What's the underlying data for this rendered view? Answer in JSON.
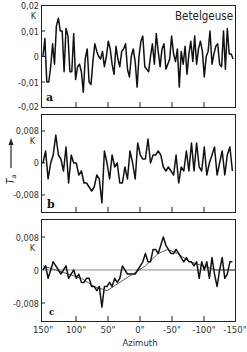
{
  "chart_data": [
    {
      "type": "line",
      "panel": "a",
      "title": "Betelgeuse",
      "ylabel": "T_a (K)",
      "xlabel": "",
      "yunit": "K",
      "ylim": [
        -0.02,
        0.02
      ],
      "yticks": [
        "0,02",
        "0,01",
        "0",
        "-0,01",
        "-0,02"
      ],
      "xlim": [
        150,
        -150
      ],
      "x": [
        150,
        147,
        144,
        141,
        138,
        135,
        132,
        129,
        126,
        123,
        120,
        117,
        114,
        111,
        108,
        105,
        102,
        99,
        96,
        93,
        90,
        87,
        84,
        81,
        78,
        75,
        72,
        69,
        66,
        63,
        60,
        57,
        54,
        51,
        48,
        45,
        42,
        39,
        36,
        33,
        30,
        27,
        24,
        21,
        18,
        15,
        12,
        9,
        6,
        3,
        0,
        -3,
        -6,
        -9,
        -12,
        -15,
        -18,
        -21,
        -24,
        -27,
        -30,
        -33,
        -36,
        -39,
        -42,
        -45,
        -48,
        -51,
        -54,
        -57,
        -60,
        -63,
        -66,
        -69,
        -72,
        -75,
        -78,
        -81,
        -84,
        -87,
        -90,
        -93,
        -96,
        -99,
        -102,
        -105,
        -108,
        -111,
        -114,
        -117,
        -120,
        -123,
        -126,
        -129,
        -132,
        -135,
        -138,
        -141,
        -144,
        -147
      ],
      "values": [
        0.0,
        0.007,
        -0.01,
        -0.01,
        -0.004,
        0.005,
        -0.003,
        0.012,
        0.015,
        0.01,
        0.01,
        -0.006,
        0.011,
        0.008,
        -0.006,
        -0.006,
        0.009,
        -0.009,
        -0.004,
        -0.003,
        -0.006,
        -0.014,
        -0.001,
        0.003,
        -0.01,
        -0.011,
        -0.002,
        0.005,
        0.002,
        0.0,
        -0.001,
        0.002,
        -0.004,
        0.0,
        0.006,
        0.003,
        -0.003,
        -0.007,
        0.004,
        -0.001,
        -0.004,
        0.002,
        0.003,
        0.005,
        -0.005,
        -0.008,
        0.0,
        0.003,
        -0.002,
        -0.012,
        0.0,
        0.006,
        0.008,
        -0.004,
        -0.005,
        -0.006,
        0.0,
        0.005,
        -0.003,
        0.009,
        0.002,
        -0.004,
        0.003,
        0.005,
        -0.005,
        -0.003,
        -0.001,
        0.008,
        0.001,
        -0.002,
        0.003,
        -0.012,
        0.002,
        -0.003,
        0.004,
        -0.007,
        0.001,
        0.006,
        -0.002,
        0.008,
        -0.003,
        0.003,
        0.006,
        0.002,
        -0.008,
        0.0,
        0.002,
        0.01,
        -0.003,
        0.001,
        0.004,
        0.005,
        -0.003,
        -0.004,
        0.01,
        -0.005,
        0.011,
        0.001,
        0.001,
        -0.001
      ]
    },
    {
      "type": "line",
      "panel": "b",
      "ylabel": "T_a (K)",
      "yunit": "K",
      "ylim": [
        -0.0125,
        0.0125
      ],
      "yticks": [
        "0,008",
        "0",
        "-0,008"
      ],
      "xlim": [
        150,
        -150
      ],
      "x": [
        150,
        146,
        142,
        138,
        134,
        130,
        126,
        122,
        118,
        114,
        110,
        106,
        102,
        98,
        94,
        90,
        86,
        82,
        78,
        74,
        70,
        66,
        62,
        58,
        54,
        50,
        46,
        42,
        38,
        34,
        30,
        26,
        22,
        18,
        14,
        10,
        6,
        2,
        -2,
        -6,
        -10,
        -14,
        -18,
        -22,
        -26,
        -30,
        -34,
        -38,
        -42,
        -46,
        -50,
        -54,
        -58,
        -62,
        -66,
        -70,
        -74,
        -78,
        -82,
        -86,
        -90,
        -94,
        -98,
        -102,
        -106,
        -110,
        -114,
        -118,
        -122,
        -126,
        -130,
        -134,
        -138,
        -142,
        -146
      ],
      "values": [
        0.0,
        0.003,
        -0.004,
        0.0,
        0.002,
        0.007,
        0.002,
        0.001,
        -0.002,
        0.004,
        -0.005,
        0.002,
        0.0,
        0.0,
        -0.003,
        -0.002,
        -0.005,
        -0.005,
        -0.006,
        -0.007,
        -0.006,
        -0.003,
        -0.004,
        -0.01,
        0.003,
        0.0,
        -0.004,
        0.002,
        -0.001,
        0.0,
        -0.005,
        -0.005,
        -0.001,
        -0.004,
        0.003,
        0.0,
        -0.004,
        0.005,
        0.002,
        0.001,
        0.001,
        0.006,
        0.0,
        0.002,
        0.002,
        0.003,
        0.002,
        -0.001,
        -0.002,
        -0.001,
        -0.002,
        -0.003,
        0.002,
        -0.005,
        -0.001,
        -0.002,
        0.003,
        -0.002,
        0.005,
        -0.002,
        0.005,
        -0.001,
        -0.002,
        0.004,
        -0.003,
        0.0,
        0.002,
        0.004,
        -0.003,
        0.0,
        0.003,
        -0.003,
        0.002,
        0.004,
        -0.002
      ]
    },
    {
      "type": "line",
      "panel": "c",
      "xlabel": "Azimuth",
      "ylabel": "T_a (K)",
      "yunit": "K",
      "ylim": [
        -0.0125,
        0.0125
      ],
      "yticks": [
        "0,008",
        "0",
        "-0,008"
      ],
      "xlim": [
        150,
        -150
      ],
      "xticks": [
        "150\"",
        "100\"",
        "50\"",
        "0\"",
        "-50\"",
        "-100\"",
        "-150\""
      ],
      "series": [
        {
          "name": "data",
          "x": [
            150,
            146,
            142,
            138,
            134,
            130,
            126,
            122,
            118,
            114,
            110,
            106,
            102,
            98,
            94,
            90,
            86,
            82,
            78,
            74,
            70,
            66,
            62,
            58,
            54,
            50,
            46,
            42,
            38,
            34,
            30,
            26,
            22,
            18,
            14,
            10,
            6,
            2,
            -2,
            -6,
            -10,
            -14,
            -18,
            -22,
            -26,
            -30,
            -34,
            -38,
            -42,
            -46,
            -50,
            -54,
            -58,
            -62,
            -66,
            -70,
            -74,
            -78,
            -82,
            -86,
            -90,
            -94,
            -98,
            -102,
            -106,
            -110,
            -114,
            -118,
            -122,
            -126,
            -130,
            -134,
            -138,
            -142,
            -146
          ],
          "values": [
            0.0,
            0.001,
            -0.002,
            0.0,
            0.002,
            0.001,
            0.0,
            -0.001,
            0.0,
            0.001,
            -0.002,
            -0.001,
            0.0,
            -0.002,
            -0.001,
            -0.003,
            -0.003,
            -0.002,
            -0.002,
            -0.004,
            -0.004,
            -0.005,
            -0.004,
            -0.009,
            -0.004,
            -0.004,
            -0.003,
            -0.004,
            -0.002,
            -0.003,
            -0.002,
            0.001,
            0.0,
            -0.001,
            -0.001,
            -0.001,
            -0.001,
            0.0,
            0.001,
            0.002,
            0.004,
            0.002,
            0.002,
            0.005,
            0.005,
            0.004,
            0.006,
            0.008,
            0.006,
            0.005,
            0.004,
            0.004,
            0.005,
            0.004,
            0.003,
            0.002,
            0.003,
            0.002,
            0.002,
            0.001,
            0.002,
            -0.002,
            0.002,
            0.0,
            0.002,
            -0.002,
            0.003,
            -0.001,
            -0.004,
            0.0,
            0.003,
            -0.002,
            -0.001,
            0.002,
            0.002
          ]
        },
        {
          "name": "smooth fit",
          "x": [
            150,
            130,
            110,
            90,
            70,
            50,
            40,
            30,
            10,
            -10,
            -30,
            -45,
            -60,
            -80,
            -100,
            -120,
            -150
          ],
          "values": [
            0.001,
            0.0,
            -0.001,
            -0.002,
            -0.004,
            -0.005,
            -0.004,
            -0.003,
            -0.001,
            0.001,
            0.004,
            0.005,
            0.004,
            0.002,
            0.001,
            0.0,
            0.0
          ]
        }
      ]
    }
  ],
  "labels": {
    "title": "Betelgeuse",
    "panel_a": "a",
    "panel_b": "b",
    "panel_c": "c",
    "y_unit": "K",
    "y_axis_symbol": "T",
    "y_axis_subscript": "a",
    "x_axis": "Azimuth",
    "a_ticks": [
      "0,02",
      "0,01",
      "0",
      "-0,01",
      "-0,02"
    ],
    "b_ticks": [
      "0,008",
      "0",
      "-0,008"
    ],
    "c_ticks": [
      "0,008",
      "0",
      "-0,008"
    ],
    "x_ticks": [
      "150\"",
      "100\"",
      "50\"",
      "0\"",
      "-50\"",
      "-100\"",
      "-150\""
    ]
  }
}
